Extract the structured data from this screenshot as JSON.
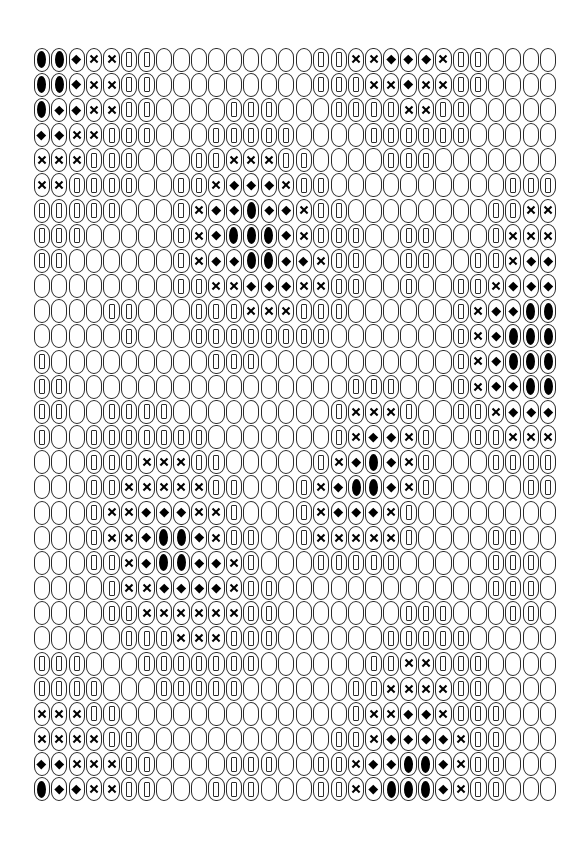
{
  "grid": {
    "columns": 30,
    "rows_count": 30,
    "legend": {
      "B": "black-oval",
      "D": "diamond",
      "X": "cross",
      "R": "rectangle",
      "E": "empty"
    },
    "rows": [
      "BBDXXRREEEEEEEEERRXXDDDXRREEEE",
      "BBDXXRREEEEEEEEERRRXXDXXRREEEE",
      "BDDXXRREEEERRREEERRRRXXRREEEEE",
      "DDXXRRREEERRRRREEEERRRRRREEEEE",
      "XXXRRREEERRXXXRREEEERRREEEEEEE",
      "XXRRRREERRXDDDXRREEEEEEEEEERRR",
      "RRRRREEERXDDBDDXRREEEEEEEERRXX",
      "RRREEEEERXDBBBDXRRREERREEERXXX",
      "RREEEEEERXDDBBDDXRREERREERRXDD",
      "EEEEEEEERRXXDDDXXRREEREERRXDDD",
      "EEEERREEERRRXXXRRREEEEEERXDDBB",
      "EEEEEREEERRRRRRRREEEEEEERXDBBB",
      "REEEEEEEEERRREEEEEEEEEEERXDBBB",
      "RREEEEEEEEEEEEEEEERRREEERXDDBB",
      "RREERRRREEEEEEEEERXXXREERRXDDD",
      "REERRRRRRREEEEEEERXDDXREERRXXX",
      "EEERRRXXXRREEEEERXDBDXREEERRRR",
      "EEERRXXXXXRREEERXDBBDXREEEEERR",
      "EEERXXDDDXXREEERXDDDXREEEEEEEE",
      "EEERXXDBBDXRREERXXXXXREEEERREE",
      "EEERRXDBBDDXREEERRRRREEEEERRRE",
      "EEEERXXDDDDXRREEEEEEEEEEEERRRE",
      "EEEERRXXXXXXRREEEEEEERRREEERRE",
      "EEEEERRRXXXRRREEEEEERRRRREEEEE",
      "RRREEERRRRRRREEEEEERRXXRRREEEE",
      "RRRREEERRRRREEEEEERRXXXXRREEEE",
      "XXXRREEEEEEEEEEEEERXXDDXRRREEE",
      "XXXXRREEEEEEEEEEERRXDDDDXRREEE",
      "DDXXXRREEEERRREERRXDDBBDXRREEE",
      "BDDXXRREEERRREEERRXDBBBDXRREEE"
    ]
  }
}
